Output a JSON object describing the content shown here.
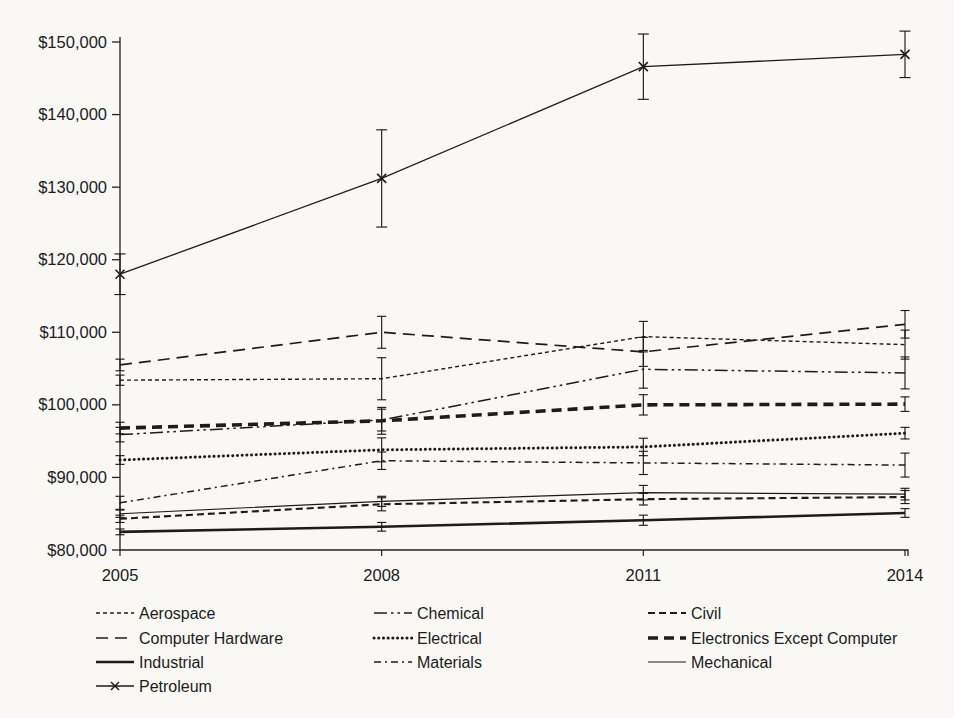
{
  "chart_data": {
    "type": "line",
    "title": "",
    "xlabel": "",
    "ylabel": "",
    "x_labels": [
      "2005",
      "2008",
      "2011",
      "2014"
    ],
    "ylim": [
      80000,
      150000
    ],
    "ytick_step": 10000,
    "ytick_labels": [
      "$80,000",
      "$90,000",
      "$100,000",
      "$110,000",
      "$120,000",
      "$130,000",
      "$140,000",
      "$150,000"
    ],
    "grid": false,
    "error_bars": true,
    "legend_position": "bottom",
    "line_color": "#1c1c1c",
    "series": [
      {
        "name": "Aerospace",
        "style": "short-dash",
        "values": [
          103400,
          103600,
          109400,
          108300
        ],
        "errors": [
          700,
          2900,
          2100,
          2000
        ]
      },
      {
        "name": "Chemical",
        "style": "dash-dot-dot",
        "values": [
          95900,
          97900,
          104900,
          104400
        ],
        "errors": [
          1000,
          1500,
          2600,
          2200
        ]
      },
      {
        "name": "Civil",
        "style": "medium-dash",
        "values": [
          84300,
          86300,
          87000,
          87300
        ],
        "errors": [
          500,
          900,
          800,
          900
        ]
      },
      {
        "name": "Computer Hardware",
        "style": "long-dash",
        "values": [
          105500,
          110000,
          107300,
          111100
        ],
        "errors": [
          800,
          2200,
          2000,
          1900
        ]
      },
      {
        "name": "Electrical",
        "style": "bold-dotted",
        "values": [
          92400,
          93800,
          94200,
          96100
        ],
        "errors": [
          600,
          1650,
          1200,
          800
        ]
      },
      {
        "name": "Electronics Except Computer",
        "style": "bold-dash",
        "values": [
          96800,
          97800,
          100000,
          100100
        ],
        "errors": [
          800,
          1850,
          1400,
          1000
        ]
      },
      {
        "name": "Industrial",
        "style": "solid-bold",
        "values": [
          82500,
          83200,
          84100,
          85100
        ],
        "errors": [
          400,
          600,
          700,
          600
        ]
      },
      {
        "name": "Materials",
        "style": "dash-dot",
        "values": [
          86500,
          92300,
          92000,
          91700
        ],
        "errors": [
          900,
          1200,
          1600,
          1650
        ]
      },
      {
        "name": "Mechanical",
        "style": "solid-thin",
        "values": [
          85000,
          86700,
          87900,
          87700
        ],
        "errors": [
          500,
          700,
          1000,
          800
        ]
      },
      {
        "name": "Petroleum",
        "style": "solid-marker-x",
        "marker": "x",
        "values": [
          118000,
          131200,
          146600,
          148300
        ],
        "errors": [
          2800,
          6700,
          4500,
          3200
        ]
      }
    ]
  },
  "legend": {
    "columns": [
      [
        "Aerospace",
        "Computer Hardware",
        "Industrial",
        "Petroleum"
      ],
      [
        "Chemical",
        "Electrical",
        "Materials"
      ],
      [
        "Civil",
        "Electronics Except Computer",
        "Mechanical"
      ]
    ]
  }
}
